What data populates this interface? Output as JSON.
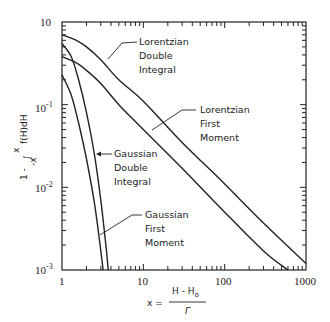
{
  "chart_data": {
    "type": "line",
    "title": "",
    "xlabel": "x = (H - H0) / Γ",
    "ylabel": "1 - ∫_{-x}^{x} f(H)dH",
    "xscale": "log",
    "yscale": "log",
    "xlim": [
      1,
      1000
    ],
    "ylim": [
      0.001,
      1
    ],
    "grid": false,
    "x_ticks": [
      "1",
      "10",
      "100",
      "1000"
    ],
    "y_ticks": [
      "10",
      "10^-1",
      "10^-2",
      "10^-3"
    ],
    "series": [
      {
        "name": "Lorentzian Double Integral",
        "points": [
          [
            1,
            0.7
          ],
          [
            1.5,
            0.6
          ],
          [
            2,
            0.5
          ],
          [
            3,
            0.35
          ],
          [
            5,
            0.2
          ],
          [
            10,
            0.11
          ],
          [
            30,
            0.035
          ],
          [
            100,
            0.011
          ],
          [
            300,
            0.0037
          ],
          [
            1000,
            0.0012
          ]
        ]
      },
      {
        "name": "Lorentzian First Moment",
        "points": [
          [
            1,
            0.38
          ],
          [
            1.5,
            0.32
          ],
          [
            2,
            0.26
          ],
          [
            3,
            0.18
          ],
          [
            5,
            0.1
          ],
          [
            10,
            0.05
          ],
          [
            30,
            0.017
          ],
          [
            100,
            0.005
          ],
          [
            300,
            0.0017
          ],
          [
            600,
            0.001
          ]
        ]
      },
      {
        "name": "Gaussian Double Integral",
        "points": [
          [
            1,
            0.55
          ],
          [
            1.3,
            0.38
          ],
          [
            1.6,
            0.2
          ],
          [
            2,
            0.08
          ],
          [
            2.5,
            0.025
          ],
          [
            3,
            0.007
          ],
          [
            3.5,
            0.0018
          ],
          [
            3.7,
            0.001
          ]
        ]
      },
      {
        "name": "Gaussian First Moment",
        "points": [
          [
            1,
            0.23
          ],
          [
            1.3,
            0.13
          ],
          [
            1.6,
            0.06
          ],
          [
            2,
            0.022
          ],
          [
            2.5,
            0.0065
          ],
          [
            3,
            0.0017
          ],
          [
            3.2,
            0.001
          ]
        ]
      }
    ],
    "annotations": [
      {
        "text": [
          "Lorentzian",
          "Double",
          "Integral"
        ],
        "target": "Lorentzian Double Integral"
      },
      {
        "text": [
          "Lorentzian",
          "First",
          "Moment"
        ],
        "target": "Lorentzian First Moment"
      },
      {
        "text": [
          "Gaussian",
          "Double",
          "Integral"
        ],
        "target": "Gaussian Double Integral"
      },
      {
        "text": [
          "Gaussian",
          "First",
          "Moment"
        ],
        "target": "Gaussian First Moment"
      }
    ]
  },
  "axes": {
    "y_labels": {
      "t0": "10",
      "t1": "10",
      "t1sup": "-1",
      "t2": "10",
      "t2sup": "-2",
      "t3": "10",
      "t3sup": "-3"
    },
    "x_labels": {
      "t0": "1",
      "t1": "10",
      "t2": "100",
      "t3": "1000"
    },
    "xlabel_left": "x =",
    "xlabel_num": "H - H",
    "xlabel_num_sub": "o",
    "xlabel_den": "Γ",
    "ylabel_prefix": "1 -",
    "ylabel_integral": "∫",
    "ylabel_upper": "x",
    "ylabel_lower": "-x",
    "ylabel_integrand": "f(H)dH"
  },
  "labels": {
    "lor_double": [
      "Lorentzian",
      "Double",
      "Integral"
    ],
    "lor_first": [
      "Lorentzian",
      "First",
      "Moment"
    ],
    "gau_double": [
      "Gaussian",
      "Double",
      "Integral"
    ],
    "gau_first": [
      "Gaussian",
      "First",
      "Moment"
    ]
  }
}
